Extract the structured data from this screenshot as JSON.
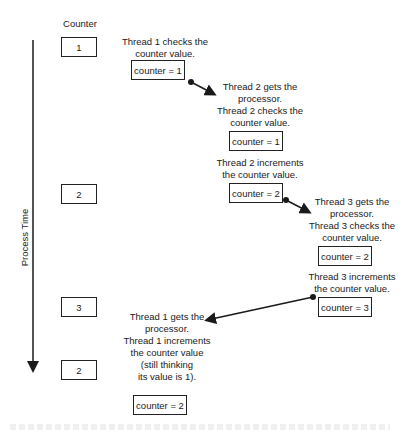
{
  "diagram": {
    "counter_header": "Counter",
    "axis_label": "Process Time",
    "counter_column": [
      {
        "value": "1"
      },
      {
        "value": "2"
      },
      {
        "value": "3"
      },
      {
        "value": "2"
      }
    ],
    "steps": [
      {
        "lines": [
          "Thread 1 checks the",
          "counter value."
        ],
        "box": "counter = 1"
      },
      {
        "lines": [
          "Thread 2 gets the",
          "processor.",
          "Thread 2 checks the",
          "counter value."
        ],
        "box": "counter = 1"
      },
      {
        "lines": [
          "Thread 2 increments",
          "the counter value."
        ],
        "box": "counter = 2"
      },
      {
        "lines": [
          "Thread 3 gets the",
          "processor.",
          "Thread 3 checks the",
          "counter value."
        ],
        "box": "counter = 2"
      },
      {
        "lines": [
          "Thread 3 increments",
          "the counter value."
        ],
        "box": "counter = 3"
      },
      {
        "lines": [
          "Thread 1 gets the",
          "processor.",
          "Thread 1 increments",
          "the counter value",
          "(still thinking",
          "its value is 1)."
        ],
        "box": "counter = 2"
      }
    ],
    "colors": {
      "line": "#1a1a1a",
      "background": "#ffffff"
    }
  }
}
